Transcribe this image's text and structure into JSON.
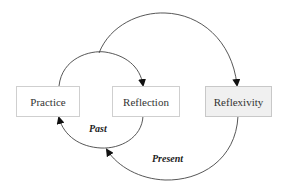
{
  "diagram": {
    "nodes": [
      {
        "id": "practice",
        "label": "Practice",
        "fill": "#ffffff"
      },
      {
        "id": "reflection",
        "label": "Reflection",
        "fill": "#ffffff"
      },
      {
        "id": "reflexivity",
        "label": "Reflexivity",
        "fill": "#f0f0f0"
      }
    ],
    "edges": [
      {
        "from": "practice",
        "to": "reflection",
        "label": ""
      },
      {
        "from": "practice",
        "to": "reflexivity",
        "label": ""
      },
      {
        "from": "reflection",
        "to": "practice",
        "label": "Past"
      },
      {
        "from": "reflexivity",
        "to": "practice",
        "label": "Present"
      }
    ],
    "labels": {
      "past": "Past",
      "present": "Present"
    }
  }
}
